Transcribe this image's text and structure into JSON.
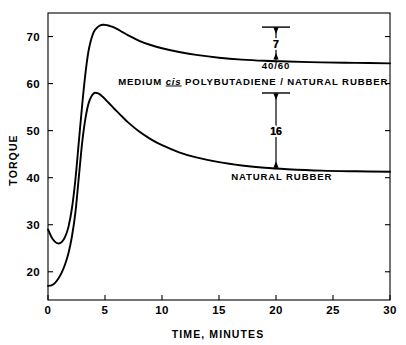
{
  "chart_data": {
    "type": "line",
    "title": "",
    "xlabel": "TIME, MINUTES",
    "ylabel": "TORQUE",
    "xlim": [
      0,
      30
    ],
    "ylim": [
      14,
      75
    ],
    "grid": false,
    "legend_position": "inline-annotations",
    "xticks": [
      "0",
      "5",
      "10",
      "15",
      "20",
      "25",
      "30"
    ],
    "xtick_values": [
      0,
      5,
      10,
      15,
      20,
      25,
      30
    ],
    "yticks": [
      "20",
      "30",
      "40",
      "50",
      "60",
      "70"
    ],
    "ytick_values": [
      20,
      30,
      40,
      50,
      60,
      70
    ],
    "series": [
      {
        "name": "40/60 MEDIUM cis POLYBUTADIENE / NATURAL RUBBER",
        "x": [
          0,
          0.3,
          0.6,
          0.9,
          1.2,
          1.5,
          1.8,
          2.1,
          2.4,
          2.7,
          3.0,
          3.3,
          3.6,
          4.0,
          4.4,
          4.8,
          5.2,
          5.6,
          6.0,
          6.5,
          7.0,
          8.0,
          9.0,
          10.0,
          11.5,
          13.0,
          15.0,
          17.0,
          19.0,
          21.0,
          24.0,
          27.0,
          30.0
        ],
        "values": [
          29.0,
          27.4,
          26.4,
          26.0,
          26.3,
          27.4,
          29.6,
          33.5,
          39.5,
          47.5,
          55.5,
          62.5,
          67.5,
          70.9,
          72.1,
          72.5,
          72.4,
          72.1,
          71.7,
          71.0,
          70.3,
          69.1,
          68.2,
          67.5,
          66.7,
          66.1,
          65.5,
          65.1,
          64.85,
          64.7,
          64.5,
          64.4,
          64.3
        ]
      },
      {
        "name": "NATURAL RUBBER",
        "x": [
          0,
          0.3,
          0.6,
          0.9,
          1.2,
          1.5,
          1.8,
          2.1,
          2.4,
          2.7,
          3.0,
          3.3,
          3.6,
          4.0,
          4.4,
          4.8,
          5.2,
          5.6,
          6.0,
          6.5,
          7.0,
          8.0,
          9.0,
          10.0,
          11.5,
          13.0,
          15.0,
          17.0,
          19.0,
          21.0,
          24.0,
          27.0,
          30.0
        ],
        "values": [
          17.0,
          17.1,
          17.6,
          18.5,
          19.8,
          21.6,
          24.0,
          27.5,
          32.5,
          40.0,
          47.5,
          52.8,
          56.1,
          57.9,
          57.9,
          57.2,
          56.2,
          55.2,
          54.2,
          53.0,
          51.8,
          49.8,
          48.2,
          46.9,
          45.4,
          44.3,
          43.3,
          42.6,
          42.1,
          41.8,
          41.5,
          41.35,
          41.25
        ]
      }
    ],
    "annotations": [
      {
        "name": "gap-upper",
        "value": "7",
        "x": 20,
        "y_top": 72,
        "y_bottom": 65,
        "description": "double-headed arrow showing torque difference of 7 units for the blend"
      },
      {
        "name": "gap-lower",
        "value": "16",
        "x": 20,
        "y_top": 58,
        "y_bottom": 42,
        "description": "double-headed arrow showing torque difference of 16 units for natural rubber"
      }
    ],
    "series_labels": [
      {
        "name": "blend-label-ratio",
        "text": "40/60",
        "x": 20,
        "y": 63.2
      },
      {
        "name": "blend-label-full",
        "text_before": "MEDIUM ",
        "text_italic": "cis",
        "text_after": " POLYBUTADIENE / NATURAL  RUBBER",
        "x": 18,
        "y": 59.8
      },
      {
        "name": "natural-rubber-label",
        "text": "NATURAL  RUBBER",
        "x": 20.5,
        "y": 39.5
      }
    ],
    "colors": {
      "background": "#ffffff",
      "curve": "#000000",
      "axis": "#000000",
      "text": "#000000"
    }
  }
}
